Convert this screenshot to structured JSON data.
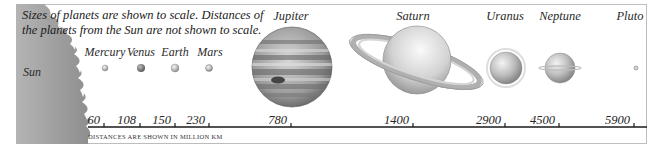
{
  "note": "Sizes of planets are shown to scale. Distances of the planets from the Sun are not shown to scale.",
  "sun": {
    "label": "Sun",
    "color": "#a3a3a3"
  },
  "planets": [
    {
      "name": "Mercury",
      "distance": "60",
      "x": 105,
      "y": 68,
      "r": 3,
      "color": "#8e8e8e"
    },
    {
      "name": "Venus",
      "distance": "108",
      "x": 141,
      "y": 68,
      "r": 4,
      "color": "#6f6f6f"
    },
    {
      "name": "Earth",
      "distance": "150",
      "x": 175,
      "y": 68,
      "r": 4,
      "color": "#b5b5b5"
    },
    {
      "name": "Mars",
      "distance": "230",
      "x": 209,
      "y": 68,
      "r": 3.5,
      "color": "#8a8a8a"
    },
    {
      "name": "Jupiter",
      "distance": "780",
      "x": 292,
      "y": 67,
      "r": 40,
      "color": "#8c8c8c"
    },
    {
      "name": "Saturn",
      "distance": "1400",
      "x": 417,
      "y": 60,
      "r": 34,
      "color": "#cfcfcf"
    },
    {
      "name": "Uranus",
      "distance": "2900",
      "x": 506,
      "y": 68,
      "r": 16,
      "color": "#a9a9a9"
    },
    {
      "name": "Neptune",
      "distance": "4500",
      "x": 560,
      "y": 68,
      "r": 15,
      "color": "#b3b3b3"
    },
    {
      "name": "Pluto",
      "distance": "5900",
      "x": 636,
      "y": 68,
      "r": 2,
      "color": "#9a9a9a"
    }
  ],
  "axis": {
    "ticks": [
      {
        "label": "60",
        "x": 104
      },
      {
        "label": "108",
        "x": 140
      },
      {
        "label": "150",
        "x": 175
      },
      {
        "label": "230",
        "x": 209
      },
      {
        "label": "780",
        "x": 291
      },
      {
        "label": "1400",
        "x": 413
      },
      {
        "label": "2900",
        "x": 505
      },
      {
        "label": "4500",
        "x": 559
      },
      {
        "label": "5900",
        "x": 634
      }
    ],
    "caption": "Distances are shown in million km",
    "unit": "million km"
  }
}
